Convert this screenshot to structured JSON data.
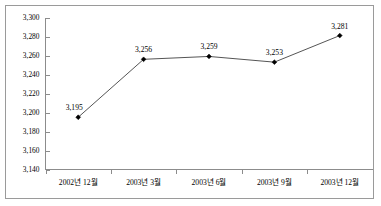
{
  "chart_data": {
    "type": "line",
    "title": "",
    "subtitle": "",
    "xlabel": "",
    "ylabel": "",
    "categories": [
      "2002년 12월",
      "2003년 3월",
      "2003년 6월",
      "2003년 9월",
      "2003년 12월"
    ],
    "values": [
      3195,
      3256,
      3259,
      3253,
      3281
    ],
    "point_labels": [
      "3,195",
      "3,256",
      "3,259",
      "3,253",
      "3,281"
    ],
    "ylim": [
      3140,
      3300
    ],
    "ytick_step": 20,
    "ytick_labels": [
      "3,300",
      "3,280",
      "3,260",
      "3,240",
      "3,220",
      "3,200",
      "3,180",
      "3,160",
      "3,140"
    ],
    "ytick_values": [
      3300,
      3280,
      3260,
      3240,
      3220,
      3200,
      3180,
      3160,
      3140
    ],
    "grid": false,
    "legend": false,
    "legend_position": "none",
    "series": [
      {
        "name": "",
        "values": [
          3195,
          3256,
          3259,
          3253,
          3281
        ],
        "line_color": "#555555",
        "marker_color": "#000000",
        "marker": "diamond"
      }
    ],
    "colors": {
      "axis": "#8c8c8c",
      "frame": "#9a9a9a",
      "text": "#000000",
      "background": "#ffffff"
    }
  }
}
